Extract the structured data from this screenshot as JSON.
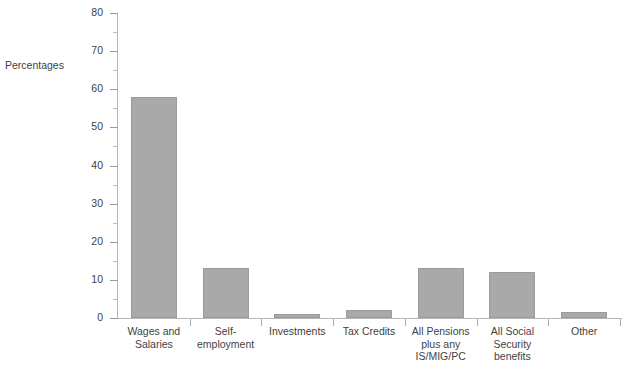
{
  "chart_data": {
    "type": "bar",
    "title": "",
    "xlabel": "",
    "ylabel": "Percentages",
    "categories": [
      "Wages and Salaries",
      "Self-employment",
      "Investments",
      "Tax Credits",
      "All Pensions plus any IS/MIG/PC",
      "All Social Security benefits",
      "Other"
    ],
    "category_lines": [
      [
        "Wages and",
        "Salaries"
      ],
      [
        "Self-",
        "employment"
      ],
      [
        "Investments"
      ],
      [
        "Tax Credits"
      ],
      [
        "All Pensions",
        "plus any",
        "IS/MIG/PC"
      ],
      [
        "All Social",
        "Security",
        "benefits"
      ],
      [
        "Other"
      ]
    ],
    "values": [
      58,
      13,
      1,
      2,
      13,
      12,
      1.5
    ],
    "ylim": [
      0,
      80
    ],
    "y_major_ticks": [
      0,
      10,
      20,
      30,
      40,
      50,
      60,
      70,
      80
    ],
    "y_minor_ticks": [
      5,
      15,
      25,
      35,
      45,
      55,
      65,
      75
    ],
    "y_tick_labels": [
      "0",
      "10",
      "20",
      "30",
      "40",
      "50",
      "60",
      "70",
      "80"
    ],
    "grid": false,
    "legend": null,
    "bar_color": "#a9a9a9",
    "bar_border_color": "#9b9b9b",
    "axis_color": "#b6b6b6",
    "text_color": "#3f3f3f"
  },
  "footer": {
    "note": ""
  }
}
